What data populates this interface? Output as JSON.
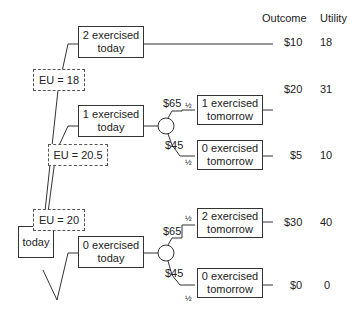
{
  "header": {
    "outcome": "Outcome",
    "utility": "Utility"
  },
  "root": {
    "label": "today"
  },
  "decisions": [
    {
      "line1": "2 exercised",
      "line2": "today",
      "eu": "EU = 18"
    },
    {
      "line1": "1 exercised",
      "line2": "today",
      "eu": "EU = 20.5"
    },
    {
      "line1": "0 exercised",
      "line2": "today",
      "eu": "EU = 20"
    }
  ],
  "chance_branches": [
    {
      "high": "$65",
      "low": "$45",
      "p_high": "½",
      "p_low": "½"
    },
    {
      "high": "$65",
      "low": "$45",
      "p_high": "½",
      "p_low": "½"
    }
  ],
  "outcomes": [
    {
      "line1": "",
      "line2": "",
      "outcome": "$10",
      "utility": "18"
    },
    {
      "line1": "1 exercised",
      "line2": "tomorrow",
      "outcome": "$20",
      "utility": "31"
    },
    {
      "line1": "0 exercised",
      "line2": "tomorrow",
      "outcome": "$5",
      "utility": "10"
    },
    {
      "line1": "2 exercised",
      "line2": "tomorrow",
      "outcome": "$30",
      "utility": "40"
    },
    {
      "line1": "0 exercised",
      "line2": "tomorrow",
      "outcome": "$0",
      "utility": "0"
    }
  ]
}
